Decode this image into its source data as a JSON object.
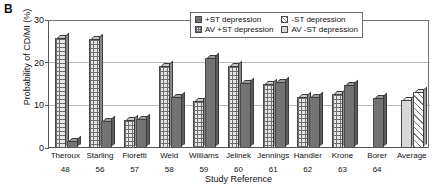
{
  "panel_label": "B",
  "chart_data": {
    "type": "bar",
    "title": "",
    "xlabel": "Study Reference",
    "ylabel": "Probability of CD/MI (%)",
    "ylim": [
      0,
      30
    ],
    "yticks": [
      0,
      10,
      20,
      30
    ],
    "grid": true,
    "legend_position": "top-right",
    "categories": [
      "Theroux",
      "Starling",
      "Fioretti",
      "Weld",
      "Williams",
      "Jelinek",
      "Jennings",
      "Handler",
      "Krone",
      "Borer",
      "Average"
    ],
    "reference_numbers": [
      "48",
      "56",
      "57",
      "58",
      "59",
      "60",
      "61",
      "62",
      "63",
      "64",
      ""
    ],
    "series": [
      {
        "name": "+ST depression",
        "pattern": "solid-dark",
        "values": [
          1.5,
          6.0,
          6.5,
          11.8,
          20.8,
          15.0,
          15.2,
          11.8,
          14.5,
          11.5,
          null
        ]
      },
      {
        "name": "AV +ST depression",
        "pattern": "grid",
        "values": [
          25.5,
          25.4,
          6.3,
          19.0,
          10.8,
          19.0,
          14.8,
          11.8,
          12.5,
          null,
          null
        ]
      },
      {
        "name": "-ST depression",
        "pattern": "diagonal",
        "values": [
          null,
          null,
          null,
          null,
          null,
          null,
          null,
          null,
          null,
          null,
          13.0
        ]
      },
      {
        "name": "AV -ST depression",
        "pattern": "lightgray",
        "values": [
          null,
          null,
          null,
          null,
          null,
          null,
          null,
          null,
          null,
          null,
          11.0
        ]
      }
    ],
    "legend": [
      {
        "label": "+ST depression",
        "pattern": "solid-dark"
      },
      {
        "label": "-ST depression",
        "pattern": "diagonal"
      },
      {
        "label": "AV +ST depression",
        "pattern": "grid"
      },
      {
        "label": "AV -ST depression",
        "pattern": "lightgray"
      }
    ],
    "bar_order_per_group": [
      [
        "grid",
        "solid-dark"
      ],
      [
        "grid",
        "solid-dark"
      ],
      [
        "grid",
        "solid-dark"
      ],
      [
        "grid",
        "solid-dark"
      ],
      [
        "grid",
        "solid-dark"
      ],
      [
        "grid",
        "solid-dark"
      ],
      [
        "grid",
        "solid-dark"
      ],
      [
        "grid",
        "solid-dark"
      ],
      [
        "grid",
        "solid-dark"
      ],
      [
        "solid-dark"
      ],
      [
        "lightgray",
        "diagonal"
      ]
    ]
  },
  "colors": {
    "solid_dark": "#737373",
    "light_gray": "#d8d8d8",
    "axis": "#555555",
    "gridline": "#b9b9b9",
    "background": "#ffffff"
  }
}
